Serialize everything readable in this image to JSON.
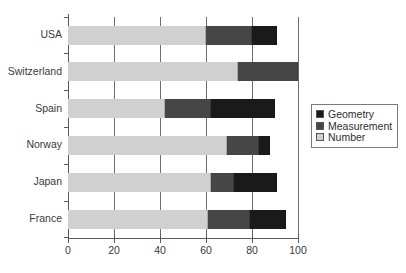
{
  "chart_data": {
    "type": "bar",
    "orientation": "horizontal",
    "stacked": true,
    "title": "",
    "xlabel": "",
    "ylabel": "",
    "xlim": [
      0,
      100
    ],
    "xticks": [
      0,
      20,
      40,
      60,
      80,
      100
    ],
    "xtick_labels": [
      "0",
      "20",
      "40",
      "60",
      "80",
      "100"
    ],
    "grid": true,
    "grid_axis": "x",
    "legend_position": "right",
    "categories": [
      "USA",
      "Switzerland",
      "Spain",
      "Norway",
      "Japan",
      "France"
    ],
    "series": [
      {
        "name": "Geometry",
        "color": "#1a1a1a",
        "values": [
          11,
          0,
          28,
          5,
          19,
          16
        ]
      },
      {
        "name": "Measurement",
        "color": "#464646",
        "values": [
          20,
          26,
          20,
          14,
          10,
          18
        ]
      },
      {
        "name": "Number",
        "color": "#d0d0d0",
        "values": [
          60,
          74,
          42,
          69,
          62,
          61
        ]
      }
    ],
    "stack_order": [
      "Number",
      "Measurement",
      "Geometry"
    ],
    "totals": [
      91,
      100,
      90,
      88,
      91,
      95
    ]
  },
  "legend": {
    "items": [
      {
        "label": "Geometry",
        "color": "#1a1a1a"
      },
      {
        "label": "Measurement",
        "color": "#464646"
      },
      {
        "label": "Number",
        "color": "#d0d0d0"
      }
    ]
  },
  "axis": {
    "y_categories": [
      "USA",
      "Switzerland",
      "Spain",
      "Norway",
      "Japan",
      "France"
    ],
    "x_tick_labels": [
      "0",
      "20",
      "40",
      "60",
      "80",
      "100"
    ]
  },
  "colors": {
    "geometry": "#1a1a1a",
    "measurement": "#464646",
    "number": "#d0d0d0",
    "axis": "#5a5a5a",
    "grid": "#6e6e6e",
    "background": "#ffffff",
    "text": "#333333"
  }
}
